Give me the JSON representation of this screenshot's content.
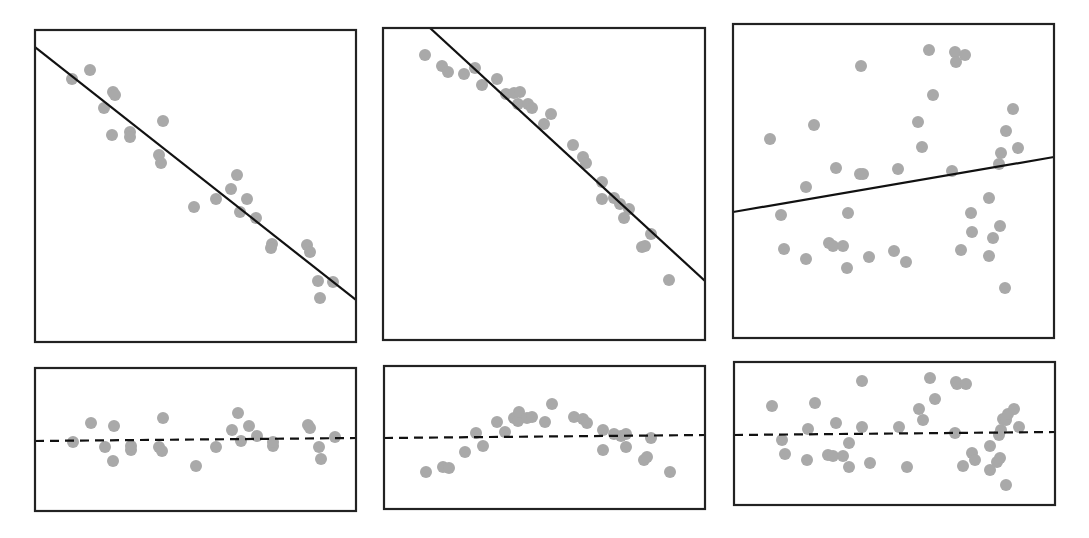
{
  "chart_data": [
    {
      "type": "scatter",
      "panel": "top-left",
      "title": "",
      "xlabel": "",
      "ylabel": "",
      "box": {
        "x": 35,
        "y": 30,
        "w": 321,
        "h": 312
      },
      "fit_line": {
        "style": "solid",
        "x1": 35,
        "y1": 47,
        "x2": 356,
        "y2": 300
      },
      "points": [
        [
          72,
          79
        ],
        [
          90,
          70
        ],
        [
          113,
          92
        ],
        [
          115,
          95
        ],
        [
          104,
          108
        ],
        [
          112,
          135
        ],
        [
          130,
          132
        ],
        [
          130,
          137
        ],
        [
          163,
          121
        ],
        [
          159,
          155
        ],
        [
          161,
          163
        ],
        [
          194,
          207
        ],
        [
          216,
          199
        ],
        [
          231,
          189
        ],
        [
          237,
          175
        ],
        [
          247,
          199
        ],
        [
          240,
          212
        ],
        [
          256,
          218
        ],
        [
          272,
          244
        ],
        [
          271,
          248
        ],
        [
          307,
          245
        ],
        [
          310,
          252
        ],
        [
          318,
          281
        ],
        [
          333,
          282
        ],
        [
          320,
          298
        ]
      ],
      "description": "Strong negative linear relationship; points close to the fitted line"
    },
    {
      "type": "scatter",
      "panel": "top-middle",
      "title": "",
      "xlabel": "",
      "ylabel": "",
      "box": {
        "x": 383,
        "y": 28,
        "w": 322,
        "h": 312
      },
      "fit_line": {
        "style": "solid",
        "x1": 430,
        "y1": 28,
        "x2": 705,
        "y2": 281
      },
      "points": [
        [
          425,
          55
        ],
        [
          442,
          66
        ],
        [
          448,
          72
        ],
        [
          464,
          74
        ],
        [
          475,
          68
        ],
        [
          482,
          85
        ],
        [
          497,
          79
        ],
        [
          506,
          94
        ],
        [
          514,
          93
        ],
        [
          520,
          92
        ],
        [
          518,
          104
        ],
        [
          528,
          104
        ],
        [
          532,
          108
        ],
        [
          551,
          114
        ],
        [
          544,
          124
        ],
        [
          573,
          145
        ],
        [
          583,
          157
        ],
        [
          586,
          163
        ],
        [
          602,
          182
        ],
        [
          602,
          199
        ],
        [
          614,
          198
        ],
        [
          620,
          204
        ],
        [
          629,
          209
        ],
        [
          624,
          218
        ],
        [
          651,
          234
        ],
        [
          642,
          247
        ],
        [
          645,
          246
        ],
        [
          669,
          280
        ]
      ],
      "description": "Negative relationship with curvature; points arch above the line in the middle"
    },
    {
      "type": "scatter",
      "panel": "top-right",
      "title": "",
      "xlabel": "",
      "ylabel": "",
      "box": {
        "x": 733,
        "y": 24,
        "w": 321,
        "h": 314
      },
      "fit_line": {
        "style": "solid",
        "x1": 733,
        "y1": 212,
        "x2": 1054,
        "y2": 157
      },
      "points": [
        [
          770,
          139
        ],
        [
          814,
          125
        ],
        [
          861,
          66
        ],
        [
          929,
          50
        ],
        [
          955,
          52
        ],
        [
          965,
          55
        ],
        [
          956,
          62
        ],
        [
          933,
          95
        ],
        [
          918,
          122
        ],
        [
          922,
          147
        ],
        [
          1013,
          109
        ],
        [
          1006,
          131
        ],
        [
          1018,
          148
        ],
        [
          1001,
          153
        ],
        [
          999,
          164
        ],
        [
          806,
          187
        ],
        [
          836,
          168
        ],
        [
          860,
          174
        ],
        [
          863,
          174
        ],
        [
          898,
          169
        ],
        [
          952,
          171
        ],
        [
          781,
          215
        ],
        [
          848,
          213
        ],
        [
          989,
          198
        ],
        [
          971,
          213
        ],
        [
          1000,
          226
        ],
        [
          972,
          232
        ],
        [
          993,
          238
        ],
        [
          784,
          249
        ],
        [
          806,
          259
        ],
        [
          829,
          243
        ],
        [
          833,
          246
        ],
        [
          843,
          246
        ],
        [
          847,
          268
        ],
        [
          869,
          257
        ],
        [
          894,
          251
        ],
        [
          906,
          262
        ],
        [
          961,
          250
        ],
        [
          989,
          256
        ],
        [
          1005,
          288
        ]
      ],
      "description": "Weak positive relationship; widely scattered points"
    },
    {
      "type": "scatter",
      "panel": "bottom-left",
      "title": "",
      "xlabel": "",
      "ylabel": "",
      "box": {
        "x": 35,
        "y": 368,
        "w": 321,
        "h": 143
      },
      "zero_line": {
        "style": "dashed",
        "x1": 35,
        "y1": 441,
        "x2": 356,
        "y2": 438
      },
      "points": [
        [
          73,
          442
        ],
        [
          91,
          423
        ],
        [
          105,
          447
        ],
        [
          114,
          426
        ],
        [
          113,
          461
        ],
        [
          131,
          450
        ],
        [
          131,
          446
        ],
        [
          163,
          418
        ],
        [
          159,
          447
        ],
        [
          162,
          451
        ],
        [
          196,
          466
        ],
        [
          216,
          447
        ],
        [
          232,
          430
        ],
        [
          238,
          413
        ],
        [
          241,
          441
        ],
        [
          249,
          426
        ],
        [
          257,
          436
        ],
        [
          273,
          446
        ],
        [
          273,
          442
        ],
        [
          308,
          425
        ],
        [
          310,
          428
        ],
        [
          319,
          447
        ],
        [
          321,
          459
        ],
        [
          335,
          437
        ]
      ],
      "description": "Residuals for top-left panel: random scatter around zero"
    },
    {
      "type": "scatter",
      "panel": "bottom-middle",
      "title": "",
      "xlabel": "",
      "ylabel": "",
      "box": {
        "x": 384,
        "y": 366,
        "w": 321,
        "h": 143
      },
      "zero_line": {
        "style": "dashed",
        "x1": 384,
        "y1": 438,
        "x2": 705,
        "y2": 435
      },
      "points": [
        [
          426,
          472
        ],
        [
          443,
          467
        ],
        [
          449,
          468
        ],
        [
          465,
          452
        ],
        [
          476,
          433
        ],
        [
          483,
          446
        ],
        [
          497,
          422
        ],
        [
          505,
          432
        ],
        [
          514,
          418
        ],
        [
          518,
          421
        ],
        [
          519,
          412
        ],
        [
          527,
          418
        ],
        [
          532,
          417
        ],
        [
          545,
          422
        ],
        [
          552,
          404
        ],
        [
          574,
          417
        ],
        [
          583,
          419
        ],
        [
          587,
          423
        ],
        [
          603,
          430
        ],
        [
          603,
          450
        ],
        [
          614,
          434
        ],
        [
          621,
          436
        ],
        [
          626,
          434
        ],
        [
          626,
          447
        ],
        [
          651,
          438
        ],
        [
          644,
          460
        ],
        [
          647,
          457
        ],
        [
          670,
          472
        ]
      ],
      "description": "Residuals for top-middle panel: inverted-U pattern indicating non-linearity"
    },
    {
      "type": "scatter",
      "panel": "bottom-right",
      "title": "",
      "xlabel": "",
      "ylabel": "",
      "box": {
        "x": 734,
        "y": 362,
        "w": 321,
        "h": 143
      },
      "zero_line": {
        "style": "dashed",
        "x1": 734,
        "y1": 435,
        "x2": 1055,
        "y2": 432
      },
      "points": [
        [
          772,
          406
        ],
        [
          782,
          440
        ],
        [
          785,
          454
        ],
        [
          807,
          460
        ],
        [
          815,
          403
        ],
        [
          808,
          429
        ],
        [
          836,
          423
        ],
        [
          828,
          455
        ],
        [
          833,
          456
        ],
        [
          843,
          456
        ],
        [
          849,
          443
        ],
        [
          849,
          467
        ],
        [
          862,
          381
        ],
        [
          862,
          427
        ],
        [
          870,
          463
        ],
        [
          899,
          427
        ],
        [
          907,
          467
        ],
        [
          919,
          409
        ],
        [
          923,
          420
        ],
        [
          930,
          378
        ],
        [
          935,
          399
        ],
        [
          956,
          382
        ],
        [
          957,
          384
        ],
        [
          966,
          384
        ],
        [
          955,
          433
        ],
        [
          963,
          466
        ],
        [
          972,
          453
        ],
        [
          975,
          460
        ],
        [
          990,
          446
        ],
        [
          990,
          470
        ],
        [
          997,
          462
        ],
        [
          999,
          435
        ],
        [
          1001,
          430
        ],
        [
          1003,
          419
        ],
        [
          1006,
          420
        ],
        [
          1008,
          414
        ],
        [
          1014,
          409
        ],
        [
          1019,
          427
        ],
        [
          1006,
          485
        ],
        [
          1000,
          458
        ]
      ],
      "description": "Residuals for top-right panel: large random scatter around zero"
    }
  ],
  "style": {
    "point_color": "#a9a9a9",
    "point_radius": 6,
    "line_color": "#111111",
    "frame_color": "#222222",
    "background": "#ffffff"
  }
}
